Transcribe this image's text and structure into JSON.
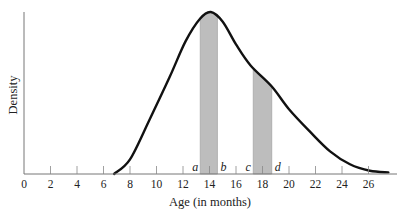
{
  "chart_data": {
    "type": "area",
    "title": "",
    "xlabel": "Age (in months)",
    "ylabel": "Density",
    "xlim": [
      0,
      28
    ],
    "x_ticks": [
      0,
      2,
      4,
      6,
      8,
      10,
      12,
      14,
      16,
      18,
      20,
      22,
      24,
      26
    ],
    "grid": false,
    "legend": null,
    "curve": {
      "x": [
        6.8,
        8,
        9.5,
        11,
        12.2,
        13.3,
        14.1,
        15,
        16,
        17.1,
        18.7,
        20,
        21.6,
        23.1,
        24.6,
        26.1,
        27.5
      ],
      "density_rel": [
        0.0,
        0.09,
        0.34,
        0.6,
        0.82,
        0.96,
        1.0,
        0.94,
        0.8,
        0.67,
        0.54,
        0.4,
        0.26,
        0.14,
        0.06,
        0.02,
        0.01
      ]
    },
    "shaded_regions": [
      {
        "label_left": "a",
        "label_right": "b",
        "from": 13.3,
        "to": 14.6
      },
      {
        "label_left": "c",
        "label_right": "d",
        "from": 17.3,
        "to": 18.7
      }
    ],
    "annotations": [
      "a",
      "b",
      "c",
      "d"
    ]
  }
}
